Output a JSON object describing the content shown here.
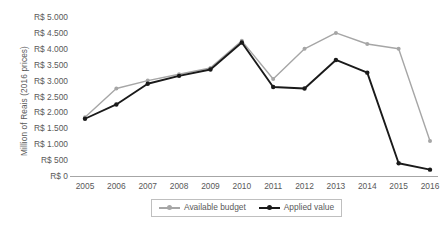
{
  "chart_data": {
    "type": "line",
    "title": "",
    "xlabel": "",
    "ylabel": "Million of Reais (2016 prices)",
    "x": [
      2005,
      2006,
      2007,
      2008,
      2009,
      2010,
      2011,
      2012,
      2013,
      2014,
      2015,
      2016
    ],
    "xtick_labels": [
      "2005",
      "2006",
      "2007",
      "2008",
      "2009",
      "2010",
      "2011",
      "2012",
      "2013",
      "2014",
      "2015",
      "2016"
    ],
    "ytick_labels": [
      "R$ 5.000",
      "R$ 4.500",
      "R$ 4.000",
      "R$ 3.500",
      "R$ 3.000",
      "R$ 2.500",
      "R$ 2.000",
      "R$ 1.500",
      "R$ 1.000",
      "R$ 500",
      "R$ 0"
    ],
    "ytick_values": [
      5000,
      4500,
      4000,
      3500,
      3000,
      2500,
      2000,
      1500,
      1000,
      500,
      0
    ],
    "ylim": [
      0,
      5000
    ],
    "grid": false,
    "legend_position": "bottom",
    "series": [
      {
        "name": "Available budget",
        "color": "#a6a6a6",
        "marker": "circle",
        "values": [
          1850,
          2750,
          3000,
          3200,
          3400,
          4250,
          3050,
          4000,
          4500,
          4150,
          4000,
          1100
        ]
      },
      {
        "name": "Applied value",
        "color": "#1a1a1a",
        "marker": "circle",
        "values": [
          1800,
          2250,
          2900,
          3150,
          3350,
          4200,
          2800,
          2750,
          3650,
          3250,
          400,
          200
        ]
      }
    ]
  },
  "legend": {
    "items": [
      {
        "label": "Available budget",
        "color": "#a6a6a6"
      },
      {
        "label": "Applied value",
        "color": "#1a1a1a"
      }
    ]
  },
  "axis": {
    "y_title": "Million of Reais (2016 prices)",
    "axis_color": "#a6a6a6"
  }
}
